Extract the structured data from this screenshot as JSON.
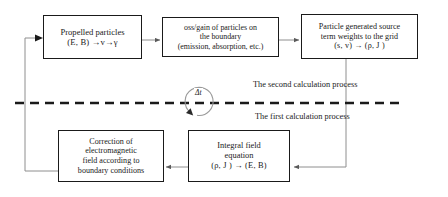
{
  "diagram": {
    "background_color": "#ffffff",
    "line_color": "#1a1a1a",
    "nodes": {
      "propelled_particles": {
        "line1": "Propelled particles",
        "line2_prefix": "(",
        "line2": "(E, B)  →v→γ"
      },
      "loss_gain": {
        "line1": "oss/gain of particles on",
        "line2": "the boundary",
        "line3": "(emission, absorption, etc.)"
      },
      "source_term": {
        "line1": "Particle generated source",
        "line2": "term weights to the grid",
        "line3": "(s,  v)  →  (ρ,  J )"
      },
      "correction": {
        "line1": "Correction of",
        "line2": "electromagnetic",
        "line3": "field according to",
        "line4": "boundary conditions"
      },
      "integral_field": {
        "line1": "Integral field",
        "line2": "equation",
        "line3": "(ρ,  J )  →  (E,  B)"
      }
    },
    "labels": {
      "second_process": "The second calculation process",
      "first_process": "The first calculation process",
      "delta_t": "Δt"
    }
  }
}
